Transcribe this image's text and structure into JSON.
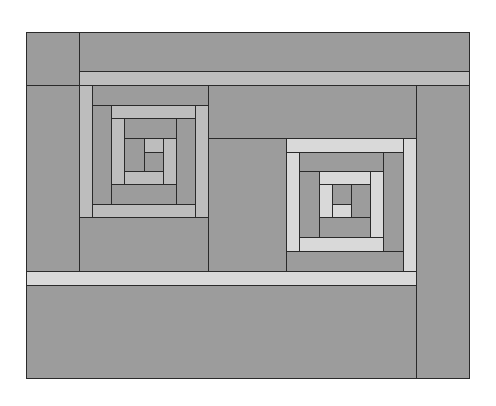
{
  "colors": {
    "dark": "#9c9c9c",
    "medium_light": "#bdbdbd",
    "light": "#d9d9d9",
    "line": "#2a2a2a",
    "background": "#ffffff"
  },
  "frame": {
    "x": 26,
    "y": 32,
    "w": 444,
    "h": 347
  },
  "pieces": [
    {
      "name": "top-left-corner",
      "x": 26,
      "y": 32,
      "w": 54,
      "h": 54,
      "tone": "dark"
    },
    {
      "name": "top-band",
      "x": 79,
      "y": 32,
      "w": 391,
      "h": 40,
      "tone": "dark"
    },
    {
      "name": "top-light-strip",
      "x": 79,
      "y": 71,
      "w": 391,
      "h": 15,
      "tone": "medium_light"
    },
    {
      "name": "left-column",
      "x": 26,
      "y": 85,
      "w": 54,
      "h": 187,
      "tone": "dark"
    },
    {
      "name": "right-column",
      "x": 416,
      "y": 85,
      "w": 54,
      "h": 294,
      "tone": "dark"
    },
    {
      "name": "middle-top-block",
      "x": 208,
      "y": 85,
      "w": 209,
      "h": 54,
      "tone": "dark"
    },
    {
      "name": "middle-filler",
      "x": 208,
      "y": 138,
      "w": 80,
      "h": 134,
      "tone": "dark"
    },
    {
      "name": "left-block-below",
      "x": 79,
      "y": 217,
      "w": 130,
      "h": 55,
      "tone": "dark"
    },
    {
      "name": "bottom-light-strip",
      "x": 26,
      "y": 271,
      "w": 391,
      "h": 15,
      "tone": "light"
    },
    {
      "name": "bottom-band",
      "x": 26,
      "y": 285,
      "w": 391,
      "h": 94,
      "tone": "dark"
    },
    {
      "name": "left-block-left-strip",
      "x": 79,
      "y": 85,
      "w": 14,
      "h": 133,
      "tone": "medium_light"
    },
    {
      "name": "left-block-top-strip",
      "x": 92,
      "y": 85,
      "w": 117,
      "h": 21,
      "tone": "dark"
    },
    {
      "name": "left-block-right-strip",
      "x": 195,
      "y": 105,
      "w": 14,
      "h": 113,
      "tone": "medium_light"
    },
    {
      "name": "left-block-bottom-strip",
      "x": 92,
      "y": 204,
      "w": 104,
      "h": 14,
      "tone": "medium_light"
    },
    {
      "name": "left-block-ring2-left",
      "x": 92,
      "y": 105,
      "w": 21,
      "h": 100,
      "tone": "dark"
    },
    {
      "name": "left-block-ring2-top",
      "x": 111,
      "y": 105,
      "w": 85,
      "h": 14,
      "tone": "medium_light"
    },
    {
      "name": "left-block-ring2-right",
      "x": 176,
      "y": 118,
      "w": 20,
      "h": 87,
      "tone": "dark"
    },
    {
      "name": "left-block-ring2-bottom",
      "x": 111,
      "y": 184,
      "w": 66,
      "h": 21,
      "tone": "dark"
    },
    {
      "name": "left-block-ring3-left",
      "x": 111,
      "y": 118,
      "w": 14,
      "h": 67,
      "tone": "medium_light"
    },
    {
      "name": "left-block-ring3-top",
      "x": 124,
      "y": 118,
      "w": 53,
      "h": 21,
      "tone": "dark"
    },
    {
      "name": "left-block-ring3-right",
      "x": 163,
      "y": 138,
      "w": 14,
      "h": 47,
      "tone": "medium_light"
    },
    {
      "name": "left-block-ring3-bottom",
      "x": 124,
      "y": 171,
      "w": 40,
      "h": 14,
      "tone": "medium_light"
    },
    {
      "name": "left-block-center-left",
      "x": 124,
      "y": 138,
      "w": 21,
      "h": 34,
      "tone": "dark"
    },
    {
      "name": "left-block-center-top",
      "x": 144,
      "y": 138,
      "w": 20,
      "h": 15,
      "tone": "medium_light"
    },
    {
      "name": "left-block-center-bottom",
      "x": 144,
      "y": 152,
      "w": 20,
      "h": 20,
      "tone": "dark"
    },
    {
      "name": "right-block-top-strip",
      "x": 286,
      "y": 138,
      "w": 119,
      "h": 15,
      "tone": "light"
    },
    {
      "name": "right-block-right-strip",
      "x": 403,
      "y": 138,
      "w": 14,
      "h": 134,
      "tone": "light"
    },
    {
      "name": "right-block-left-strip",
      "x": 286,
      "y": 152,
      "w": 14,
      "h": 100,
      "tone": "light"
    },
    {
      "name": "right-block-bottom-strip",
      "x": 286,
      "y": 251,
      "w": 118,
      "h": 21,
      "tone": "dark"
    },
    {
      "name": "right-block-ring2-top",
      "x": 299,
      "y": 152,
      "w": 86,
      "h": 20,
      "tone": "dark"
    },
    {
      "name": "right-block-ring2-right",
      "x": 383,
      "y": 152,
      "w": 21,
      "h": 100,
      "tone": "dark"
    },
    {
      "name": "right-block-ring2-left",
      "x": 299,
      "y": 171,
      "w": 21,
      "h": 67,
      "tone": "dark"
    },
    {
      "name": "right-block-ring2-bottom",
      "x": 299,
      "y": 237,
      "w": 85,
      "h": 15,
      "tone": "light"
    },
    {
      "name": "right-block-ring3-top",
      "x": 319,
      "y": 171,
      "w": 53,
      "h": 14,
      "tone": "light"
    },
    {
      "name": "right-block-ring3-right",
      "x": 370,
      "y": 171,
      "w": 14,
      "h": 67,
      "tone": "light"
    },
    {
      "name": "right-block-ring3-left",
      "x": 319,
      "y": 184,
      "w": 14,
      "h": 34,
      "tone": "light"
    },
    {
      "name": "right-block-ring3-bottom",
      "x": 319,
      "y": 217,
      "w": 52,
      "h": 21,
      "tone": "dark"
    },
    {
      "name": "right-block-center-right",
      "x": 351,
      "y": 184,
      "w": 20,
      "h": 34,
      "tone": "dark"
    },
    {
      "name": "right-block-center-top",
      "x": 332,
      "y": 184,
      "w": 20,
      "h": 21,
      "tone": "dark"
    },
    {
      "name": "right-block-center-bottom",
      "x": 332,
      "y": 204,
      "w": 20,
      "h": 14,
      "tone": "light"
    }
  ]
}
